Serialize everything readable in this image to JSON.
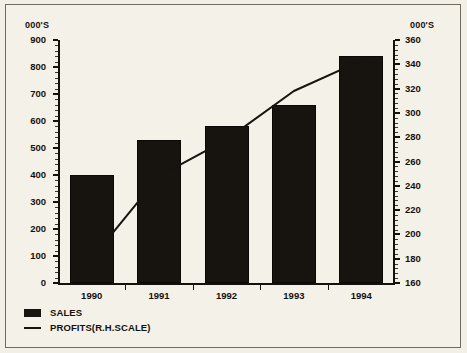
{
  "chart_data": {
    "type": "bar",
    "title": "",
    "subtitle": "",
    "xlabel": "",
    "ylabel": "000'S",
    "y2label": "000'S",
    "categories": [
      "1990",
      "1991",
      "1992",
      "1993",
      "1994"
    ],
    "ylim": [
      0,
      900
    ],
    "y2lim": [
      160,
      360
    ],
    "yticks": [
      0,
      100,
      200,
      300,
      400,
      500,
      600,
      700,
      800,
      900
    ],
    "y2ticks": [
      160,
      180,
      200,
      220,
      240,
      260,
      280,
      300,
      320,
      340,
      360
    ],
    "grid": false,
    "legend_position": "bottom-left",
    "series": [
      {
        "name": "SALES",
        "type": "bar",
        "axis": "left",
        "values": [
          400,
          530,
          580,
          660,
          840
        ],
        "color": "#17130e"
      },
      {
        "name": "PROFITS(R.H.SCALE)",
        "type": "line",
        "axis": "right",
        "values": [
          180,
          248,
          278,
          318,
          343
        ],
        "color": "#17130e"
      }
    ]
  },
  "axes": {
    "left": {
      "unit_caption": "000'S",
      "tick_labels": [
        "900",
        "800",
        "700",
        "600",
        "500",
        "400",
        "300",
        "200",
        "100",
        "0"
      ]
    },
    "right": {
      "unit_caption": "000'S",
      "tick_labels": [
        "360",
        "340",
        "320",
        "300",
        "280",
        "260",
        "240",
        "220",
        "200",
        "180",
        "160"
      ]
    },
    "bottom": {
      "tick_labels": [
        "1990",
        "1991",
        "1992",
        "1993",
        "1994"
      ]
    }
  },
  "legend": {
    "items": [
      {
        "label": "SALES",
        "marker": "filled-square-swatch"
      },
      {
        "label": "PROFITS(R.H.SCALE)",
        "marker": "line-swatch"
      }
    ]
  }
}
